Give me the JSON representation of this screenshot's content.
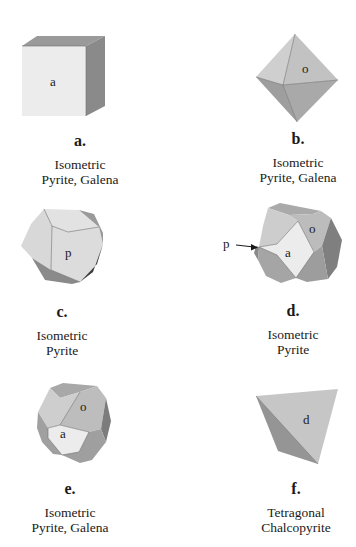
{
  "figure": {
    "panels": [
      {
        "id": "a",
        "letter": "a.",
        "form": "cube",
        "face_labels": [
          "a"
        ],
        "system": "Isometric",
        "minerals": "Pyrite, Galena"
      },
      {
        "id": "b",
        "letter": "b.",
        "form": "octahedron",
        "face_labels": [
          "o"
        ],
        "system": "Isometric",
        "minerals": "Pyrite, Galena"
      },
      {
        "id": "c",
        "letter": "c.",
        "form": "pyritohedron",
        "face_labels": [
          "p"
        ],
        "system": "Isometric",
        "minerals": "Pyrite"
      },
      {
        "id": "d",
        "letter": "d.",
        "form": "cube-octahedron-pyritohedron combination",
        "face_labels": [
          "a",
          "o"
        ],
        "pointer_label": "p",
        "system": "Isometric",
        "minerals": "Pyrite"
      },
      {
        "id": "e",
        "letter": "e.",
        "form": "cuboctahedron",
        "face_labels": [
          "a",
          "o"
        ],
        "system": "Isometric",
        "minerals": "Pyrite, Galena"
      },
      {
        "id": "f",
        "letter": "f.",
        "form": "tetrahedron (disphenoid)",
        "face_labels": [
          "d"
        ],
        "system": "Tetragonal",
        "minerals": "Chalcopyrite"
      }
    ]
  },
  "colors": {
    "background": "#ffffff",
    "face_light": "#e6e6e6",
    "face_mid": "#c4c4c4",
    "face_dark": "#8e8e8e",
    "face_darkest": "#4a4a4a",
    "text": "#1a1a1a"
  }
}
